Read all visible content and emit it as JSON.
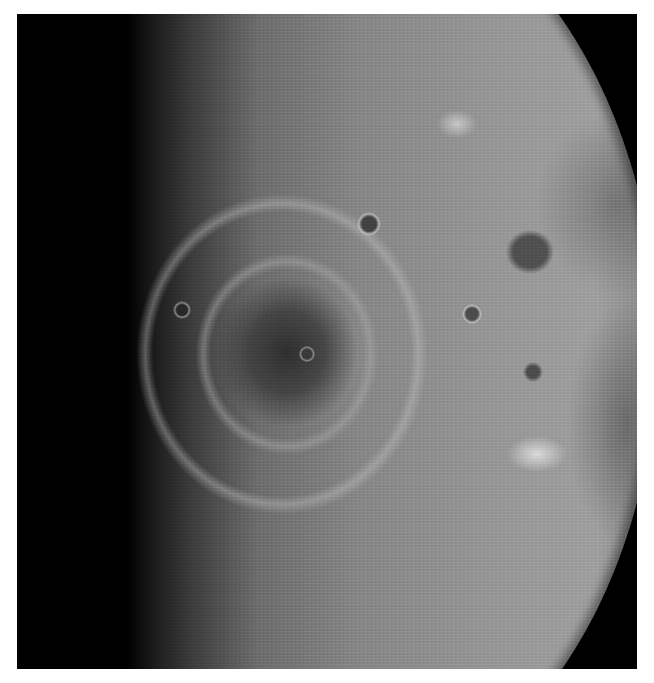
{
  "image": {
    "subject": "Lunar surface photograph showing a multi-ring impact basin near the terminator",
    "colors": {
      "background": "#ffffff",
      "space": "#000000",
      "surface_light": "#a2a2a2",
      "surface_mid": "#8a8a8a",
      "mare_dark": "#3c3c3c"
    }
  }
}
